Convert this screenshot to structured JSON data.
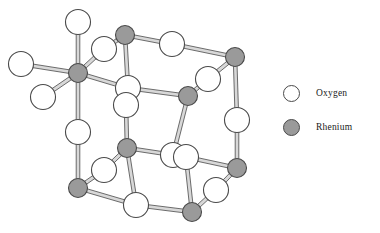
{
  "figure": {
    "type": "crystal-structure-diagram",
    "compound": "ReO3"
  },
  "legend": {
    "position": "right",
    "items": [
      {
        "key": "oxygen",
        "label": "Oxygen",
        "fill": "#ffffff",
        "stroke": "#4a4a4a",
        "radius": 8.5
      },
      {
        "key": "rhenium",
        "label": "Rhenium",
        "fill": "#9a9a9a",
        "stroke": "#4a4a4a",
        "radius": 8.5
      }
    ]
  },
  "colors": {
    "background": "#ffffff",
    "oxygen_fill": "#ffffff",
    "rhenium_fill": "#9a9a9a",
    "atom_stroke": "#4a4a4a",
    "bond_fill": "#d8d8d8",
    "bond_stroke": "#4a4a4a",
    "text": "#1a1a1a"
  },
  "structure": {
    "atom_radius_oxygen": 12.5,
    "atom_radius_rhenium": 9.5,
    "bond_width": 3.6,
    "atoms": [
      {
        "id": "O-top-axial",
        "element": "oxygen",
        "x": 78,
        "y": 22
      },
      {
        "id": "Re-front-top-left",
        "element": "rhenium",
        "x": 78,
        "y": 73
      },
      {
        "id": "O-left-axial",
        "element": "oxygen",
        "x": 21,
        "y": 64
      },
      {
        "id": "O-front-lower-left",
        "element": "oxygen",
        "x": 43,
        "y": 97
      },
      {
        "id": "O-back-upper-right",
        "element": "oxygen",
        "x": 104,
        "y": 49
      },
      {
        "id": "Re-back-top-left",
        "element": "rhenium",
        "x": 125,
        "y": 35
      },
      {
        "id": "O-top-back-edge",
        "element": "oxygen",
        "x": 172,
        "y": 44
      },
      {
        "id": "Re-back-top-right",
        "element": "rhenium",
        "x": 235,
        "y": 57
      },
      {
        "id": "O-mid-front-upper",
        "element": "oxygen",
        "x": 128,
        "y": 88
      },
      {
        "id": "O-mid-front-lower",
        "element": "oxygen",
        "x": 126,
        "y": 105
      },
      {
        "id": "O-mid-back-edge",
        "element": "oxygen",
        "x": 208,
        "y": 79
      },
      {
        "id": "Re-mid-back-left",
        "element": "rhenium",
        "x": 188,
        "y": 96
      },
      {
        "id": "O-right-vertical",
        "element": "oxygen",
        "x": 237,
        "y": 120
      },
      {
        "id": "O-left-vertical",
        "element": "oxygen",
        "x": 78,
        "y": 132
      },
      {
        "id": "Re-mid-front-left",
        "element": "rhenium",
        "x": 127,
        "y": 148
      },
      {
        "id": "O-center-front-a",
        "element": "oxygen",
        "x": 173,
        "y": 155
      },
      {
        "id": "O-center-front-b",
        "element": "oxygen",
        "x": 186,
        "y": 157
      },
      {
        "id": "Re-right-lower",
        "element": "rhenium",
        "x": 237,
        "y": 168
      },
      {
        "id": "O-lower-left-edge",
        "element": "oxygen",
        "x": 104,
        "y": 170
      },
      {
        "id": "Re-front-bot-left",
        "element": "rhenium",
        "x": 78,
        "y": 188
      },
      {
        "id": "O-bottom-front",
        "element": "oxygen",
        "x": 136,
        "y": 205
      },
      {
        "id": "Re-bottom-back",
        "element": "rhenium",
        "x": 192,
        "y": 212
      },
      {
        "id": "O-bottom-right",
        "element": "oxygen",
        "x": 216,
        "y": 190
      }
    ],
    "bonds": [
      {
        "from": "O-top-axial",
        "to": "Re-front-top-left"
      },
      {
        "from": "Re-front-top-left",
        "to": "O-left-axial"
      },
      {
        "from": "Re-front-top-left",
        "to": "O-front-lower-left"
      },
      {
        "from": "Re-front-top-left",
        "to": "O-back-upper-right"
      },
      {
        "from": "O-back-upper-right",
        "to": "Re-back-top-left"
      },
      {
        "from": "Re-front-top-left",
        "to": "O-mid-front-upper"
      },
      {
        "from": "Re-front-top-left",
        "to": "O-left-vertical"
      },
      {
        "from": "Re-back-top-left",
        "to": "O-top-back-edge"
      },
      {
        "from": "O-top-back-edge",
        "to": "Re-back-top-right"
      },
      {
        "from": "Re-back-top-left",
        "to": "O-mid-front-upper"
      },
      {
        "from": "O-mid-front-upper",
        "to": "Re-mid-back-left"
      },
      {
        "from": "Re-mid-back-left",
        "to": "O-mid-back-edge"
      },
      {
        "from": "O-mid-back-edge",
        "to": "Re-back-top-right"
      },
      {
        "from": "Re-back-top-right",
        "to": "O-right-vertical"
      },
      {
        "from": "O-right-vertical",
        "to": "Re-right-lower"
      },
      {
        "from": "O-mid-front-lower",
        "to": "Re-mid-front-left"
      },
      {
        "from": "O-left-vertical",
        "to": "Re-front-bot-left"
      },
      {
        "from": "Re-mid-front-left",
        "to": "O-center-front-a"
      },
      {
        "from": "O-center-front-b",
        "to": "Re-right-lower"
      },
      {
        "from": "Re-mid-front-left",
        "to": "O-lower-left-edge"
      },
      {
        "from": "O-lower-left-edge",
        "to": "Re-front-bot-left"
      },
      {
        "from": "Re-mid-front-left",
        "to": "O-bottom-front"
      },
      {
        "from": "Re-front-bot-left",
        "to": "O-bottom-front"
      },
      {
        "from": "O-bottom-front",
        "to": "Re-bottom-back"
      },
      {
        "from": "Re-bottom-back",
        "to": "O-bottom-right"
      },
      {
        "from": "O-bottom-right",
        "to": "Re-right-lower"
      },
      {
        "from": "O-center-front-b",
        "to": "Re-bottom-back"
      },
      {
        "from": "Re-mid-back-left",
        "to": "O-center-front-a"
      }
    ]
  }
}
